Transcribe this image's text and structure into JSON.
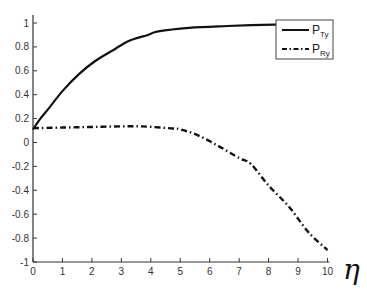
{
  "chart_data": {
    "type": "line",
    "title": "",
    "xlabel": "η",
    "ylabel": "",
    "xlim": [
      0,
      10
    ],
    "ylim": [
      -1,
      1.07
    ],
    "xticks": [
      0,
      1,
      2,
      3,
      4,
      5,
      6,
      7,
      8,
      9,
      10
    ],
    "yticks": [
      -1,
      -0.8,
      -0.6,
      -0.4,
      -0.2,
      0,
      0.2,
      0.4,
      0.6,
      0.8,
      1
    ],
    "ytick_labels": [
      "-1",
      "-0.8",
      "-0.6",
      "-0.4",
      "-0.2",
      "0",
      "0.2",
      "0.4",
      "0.6",
      "0.8",
      "1"
    ],
    "grid": false,
    "legend_position": "upper right",
    "series": [
      {
        "name": "P_Ty",
        "label_main": "P",
        "label_sub": "Ty",
        "style": "solid",
        "color": "#111111",
        "x": [
          0,
          0.25,
          0.55,
          1.0,
          1.55,
          2.1,
          2.7,
          3.25,
          3.9,
          4.25,
          5.3,
          6.6,
          7.8,
          9.0,
          10.0
        ],
        "y": [
          0.11,
          0.2,
          0.29,
          0.43,
          0.57,
          0.68,
          0.77,
          0.85,
          0.9,
          0.93,
          0.96,
          0.975,
          0.985,
          0.99,
          0.99
        ]
      },
      {
        "name": "P_Ry",
        "label_main": "P",
        "label_sub": "Ry",
        "style": "dashdot",
        "color": "#111111",
        "x": [
          0,
          1,
          2,
          3,
          3.7,
          4.6,
          5.0,
          5.6,
          6.3,
          7.0,
          7.4,
          8.0,
          8.7,
          9.35,
          10.0
        ],
        "y": [
          0.12,
          0.125,
          0.13,
          0.135,
          0.135,
          0.12,
          0.11,
          0.06,
          -0.03,
          -0.13,
          -0.18,
          -0.36,
          -0.54,
          -0.75,
          -0.9
        ]
      }
    ]
  },
  "plot_area": {
    "x0_px": 33,
    "x1_px": 327.5,
    "y_top_px": 15,
    "y1_px": 23,
    "ym1_px": 262
  },
  "legend": {
    "x": 276,
    "y": 20,
    "w": 57,
    "h": 39
  }
}
